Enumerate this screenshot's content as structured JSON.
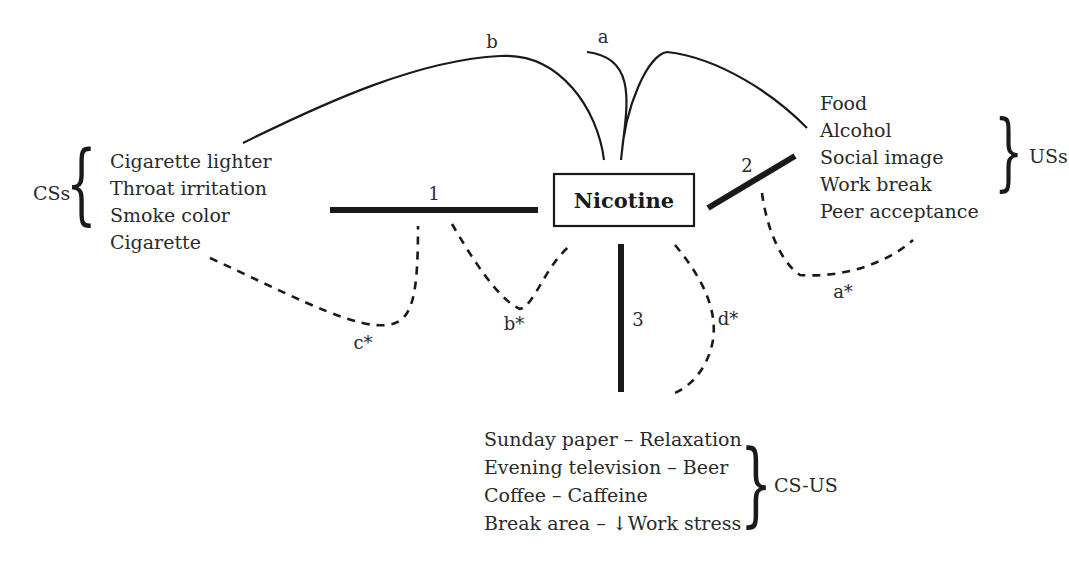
{
  "diagram": {
    "center": {
      "label": "Nicotine"
    },
    "groups": {
      "css": {
        "label": "CSs",
        "items": [
          "Cigarette lighter",
          "Throat irritation",
          "Smoke color",
          "Cigarette"
        ]
      },
      "uss": {
        "label": "USs",
        "items": [
          "Food",
          "Alcohol",
          "Social image",
          "Work break",
          "Peer acceptance"
        ]
      },
      "cs_us": {
        "label": "CS-US",
        "items": [
          "Sunday paper – Relaxation",
          "Evening television – Beer",
          "Coffee – Caffeine",
          "Break area – ↓Work stress"
        ]
      }
    },
    "blocking_lines": [
      {
        "label": "1"
      },
      {
        "label": "2"
      },
      {
        "label": "3"
      }
    ],
    "arc_labels": {
      "a": "a",
      "b": "b"
    },
    "dashed_labels": {
      "a_star": "a*",
      "b_star": "b*",
      "c_star": "c*",
      "d_star": "d*"
    },
    "colors": {
      "ink": "#1a1a1a",
      "text": "#2a2a2a",
      "background": "#ffffff"
    }
  }
}
